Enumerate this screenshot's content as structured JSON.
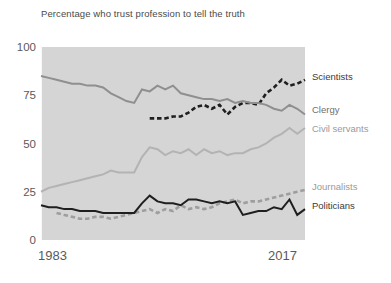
{
  "chart_data": {
    "type": "line",
    "title": "Percentage who trust profession to tell the truth",
    "xlabel": "",
    "ylabel": "",
    "xlim": [
      1983,
      2017
    ],
    "ylim": [
      0,
      100
    ],
    "x_tick_labels": [
      "1983",
      "2017"
    ],
    "y_tick_labels": [
      "0",
      "25",
      "50",
      "75",
      "100"
    ],
    "y_ticks": [
      0,
      25,
      50,
      75,
      100
    ],
    "grid": false,
    "legend_position": "right-inline",
    "plot_background": "#d5d5d5",
    "x": [
      1983,
      1984,
      1985,
      1986,
      1987,
      1988,
      1989,
      1990,
      1991,
      1992,
      1993,
      1994,
      1995,
      1996,
      1997,
      1998,
      1999,
      2000,
      2001,
      2002,
      2003,
      2004,
      2005,
      2006,
      2007,
      2008,
      2009,
      2010,
      2011,
      2012,
      2013,
      2014,
      2015,
      2016,
      2017
    ],
    "series": [
      {
        "name": "Scientists",
        "color": "#1f1f1f",
        "style": "dashed",
        "label_y_value": 85,
        "start_year": 1997,
        "values": [
          null,
          null,
          null,
          null,
          null,
          null,
          null,
          null,
          null,
          null,
          null,
          null,
          null,
          null,
          63,
          63,
          63,
          64,
          64,
          66,
          69,
          70,
          68,
          70,
          65,
          69,
          71,
          71,
          70,
          76,
          79,
          83,
          80,
          81,
          83
        ]
      },
      {
        "name": "Clergy",
        "color": "#8f8f8f",
        "style": "solid",
        "label_y_value": 68,
        "values": [
          85,
          84,
          83,
          82,
          81,
          81,
          80,
          80,
          79,
          76,
          74,
          72,
          71,
          78,
          77,
          80,
          78,
          80,
          76,
          75,
          74,
          73,
          73,
          72,
          73,
          71,
          72,
          71,
          71,
          70,
          68,
          67,
          70,
          68,
          65
        ]
      },
      {
        "name": "Civil servants",
        "color": "#b3b3b3",
        "style": "solid",
        "label_y_value": 58,
        "values": [
          25,
          27,
          28,
          29,
          30,
          31,
          32,
          33,
          34,
          36,
          35,
          35,
          35,
          43,
          48,
          47,
          44,
          46,
          45,
          47,
          44,
          47,
          45,
          46,
          44,
          45,
          45,
          47,
          48,
          50,
          53,
          55,
          58,
          55,
          58
        ]
      },
      {
        "name": "Journalists",
        "color": "#9e9e9e",
        "style": "dashed",
        "label_y_value": 28,
        "values": [
          null,
          null,
          14,
          13,
          12,
          11,
          11,
          12,
          12,
          11,
          12,
          13,
          14,
          15,
          16,
          14,
          16,
          15,
          18,
          16,
          17,
          16,
          17,
          19,
          20,
          21,
          19,
          20,
          20,
          21,
          22,
          23,
          24,
          25,
          26
        ]
      },
      {
        "name": "Politicians",
        "color": "#1f1f1f",
        "style": "solid",
        "label_y_value": 18,
        "values": [
          18,
          17,
          17,
          16,
          16,
          15,
          15,
          15,
          14,
          14,
          14,
          14,
          14,
          19,
          23,
          20,
          19,
          19,
          18,
          21,
          21,
          20,
          19,
          20,
          19,
          20,
          13,
          14,
          15,
          15,
          17,
          16,
          21,
          13,
          16
        ]
      }
    ]
  }
}
